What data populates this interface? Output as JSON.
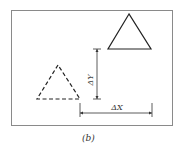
{
  "figure": {
    "caption": "(b)",
    "labels": {
      "delta_y": "ΔY",
      "delta_x": "ΔX"
    },
    "colors": {
      "stroke": "#222222",
      "frame": "#888888",
      "background": "#ffffff"
    },
    "frame": {
      "x": 11,
      "y": 10,
      "width": 162,
      "height": 116
    },
    "shapes": [
      {
        "name": "original-triangle",
        "style": "dashed",
        "points": [
          [
            58,
            65
          ],
          [
            37,
            99
          ],
          [
            80,
            99
          ]
        ]
      },
      {
        "name": "translated-triangle",
        "style": "solid",
        "points": [
          [
            129,
            14
          ],
          [
            108,
            49
          ],
          [
            151,
            49
          ]
        ]
      }
    ]
  }
}
